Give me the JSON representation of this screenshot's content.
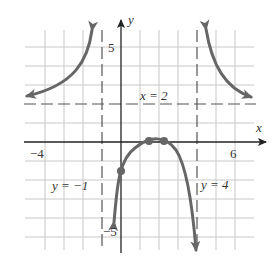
{
  "graph": {
    "axes": {
      "x_label": "x",
      "y_label": "y",
      "x_ticks": [
        {
          "value": -4,
          "label": "−4"
        },
        {
          "value": 6,
          "label": "6"
        }
      ],
      "y_ticks": [
        {
          "value": 5,
          "label": "5"
        },
        {
          "value": -5,
          "label": "−5"
        }
      ],
      "x_range": [
        -4,
        7
      ],
      "y_range": [
        -6,
        6
      ],
      "grid": true
    },
    "asymptotes": {
      "horizontal": {
        "value": 2,
        "label": "x = 2"
      },
      "vertical_left": {
        "value": -1,
        "label": "y = −1"
      },
      "vertical_right": {
        "value": 4,
        "label": "y = 4"
      }
    },
    "points": [
      {
        "x": 0,
        "y": -1.5
      },
      {
        "x": 1.5,
        "y": 0
      },
      {
        "x": 2.3,
        "y": 0
      }
    ],
    "colors": {
      "curve": "#666666",
      "grid": "#c8c8c8",
      "axis": "#222222"
    }
  }
}
